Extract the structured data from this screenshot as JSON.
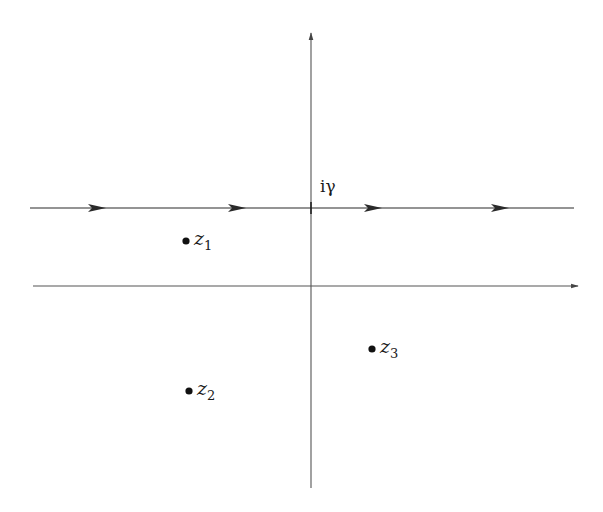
{
  "diagram": {
    "type": "complex-plane-contour",
    "colors": {
      "background": "#ffffff",
      "stroke": "#2a2a2a",
      "axis": "#555555",
      "point": "#111111"
    },
    "axes": {
      "real_axis": {
        "x1": 33,
        "y": 286,
        "x2": 578,
        "arrow": "right"
      },
      "imaginary_axis": {
        "x": 311,
        "y1": 488,
        "y2": 33,
        "arrow": "up"
      }
    },
    "contour": {
      "label": "iγ",
      "y": 208,
      "x1": 30,
      "x2": 574,
      "direction": "left-to-right",
      "arrow_positions": [
        97,
        237,
        373,
        500
      ],
      "tick_at_x": 311
    },
    "points": [
      {
        "id": "z1",
        "name": "z",
        "sub": "1",
        "x": 186,
        "y": 241
      },
      {
        "id": "z2",
        "name": "z",
        "sub": "2",
        "x": 189,
        "y": 391
      },
      {
        "id": "z3",
        "name": "z",
        "sub": "3",
        "x": 372,
        "y": 349
      }
    ]
  }
}
